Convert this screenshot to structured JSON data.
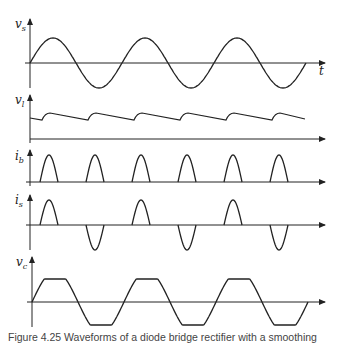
{
  "figure": {
    "caption": "Figure 4.25 Waveforms of a diode bridge rectifier with a smoothing",
    "time_label": "t",
    "panels": [
      {
        "id": "vs",
        "label_main": "v",
        "label_sub": "s",
        "description": "AC supply voltage, sinusoidal, 3 cycles"
      },
      {
        "id": "vl",
        "label_main": "v",
        "label_sub": "l",
        "description": "Load voltage, DC with sawtooth ripple, 6 ripple peaks"
      },
      {
        "id": "ib",
        "label_main": "i",
        "label_sub": "b",
        "description": "Bridge output current pulses, 6 positive pulses"
      },
      {
        "id": "is",
        "label_main": "i",
        "label_sub": "s",
        "description": "Supply current pulses, alternating positive/negative"
      },
      {
        "id": "vc",
        "label_main": "v",
        "label_sub": "c",
        "description": "Voltage with flattened peaks, 3 cycles"
      }
    ]
  },
  "colors": {
    "line": "#222222",
    "background": "#ffffff",
    "caption": "#444444"
  }
}
